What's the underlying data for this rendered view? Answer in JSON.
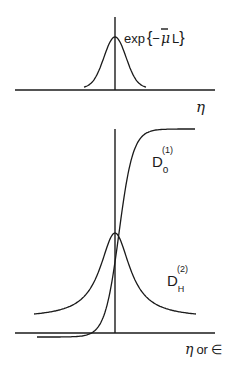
{
  "figure": {
    "top_panel": {
      "curve_label": "exp{−μ̄L}",
      "curve_label_parts": {
        "prefix": "exp",
        "open": "{",
        "minus": "−",
        "mu": "μ",
        "bar": "¯",
        "L": "L",
        "close": "}"
      },
      "x_axis_label": "η",
      "curve": {
        "shape": "gaussian-peak",
        "center": 0
      }
    },
    "bottom_panel": {
      "x_axis_label": "η or ∈",
      "x_axis_label_parts": {
        "eta": "η",
        "or": "or",
        "eps": "∈"
      },
      "curves": [
        {
          "name": "D_o^(1)",
          "base": "D",
          "sub": "o",
          "sup": "(1)",
          "shape": "sigmoid-step"
        },
        {
          "name": "D_H^(2)",
          "base": "D",
          "sub": "H",
          "sup": "(2)",
          "shape": "lorentzian-peak"
        }
      ]
    }
  }
}
